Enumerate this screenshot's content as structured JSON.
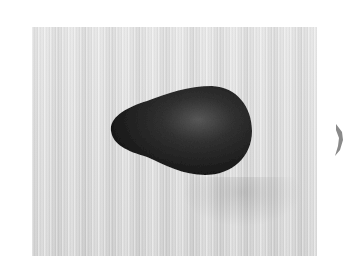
{
  "image": {
    "subject": "avocado",
    "description": "A single dark avocado lying on a light wooden surface, grayscale photo",
    "colors": {
      "background": "#ffffff",
      "surface": "#e0e0e0",
      "avocado_dark": "#1e1e1e",
      "avocado_highlight": "#5a5a5a"
    }
  },
  "controls": {
    "next_icon": "chevron-right-icon"
  }
}
